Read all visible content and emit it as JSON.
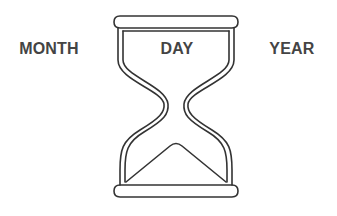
{
  "labels": {
    "left": "MONTH",
    "center": "DAY",
    "right": "YEAR"
  },
  "icon": {
    "name": "hourglass-icon",
    "stroke_color": "#333333",
    "fill_color": "#ffffff"
  },
  "colors": {
    "text": "#444444",
    "background": "#ffffff"
  }
}
